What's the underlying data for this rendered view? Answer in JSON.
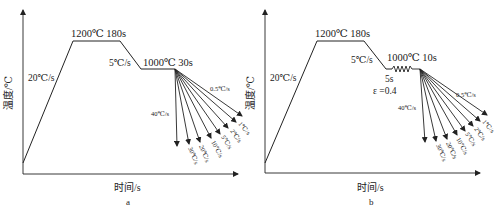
{
  "figures": [
    {
      "id": "a",
      "caption": "a",
      "y_axis_label": "温度/℃",
      "x_axis_label": "时间/s",
      "heating_rate": "20℃/s",
      "soak_label": "1200℃ 180s",
      "cool_to_hold_rate": "5℃/s",
      "hold_label": "1000℃ 30s",
      "deformation": null,
      "cooling_rates": [
        "40℃/s",
        "30℃/s",
        "20℃/s",
        "10℃/s",
        "5℃/s",
        "2℃/s",
        "1℃/s",
        "0.5℃/s"
      ]
    },
    {
      "id": "b",
      "caption": "b",
      "y_axis_label": "温度/℃",
      "x_axis_label": "时间/s",
      "heating_rate": "20℃/s",
      "soak_label": "1200℃ 180s",
      "cool_to_hold_rate": "5℃/s",
      "hold_label": "1000℃ 10s",
      "deformation": {
        "time": "5s",
        "strain": "ε =0.4"
      },
      "cooling_rates": [
        "40℃/s",
        "30℃/s",
        "20℃/s",
        "10℃/s",
        "5℃/s",
        "2℃/s",
        "1℃/s",
        "0.5℃/s"
      ]
    }
  ]
}
